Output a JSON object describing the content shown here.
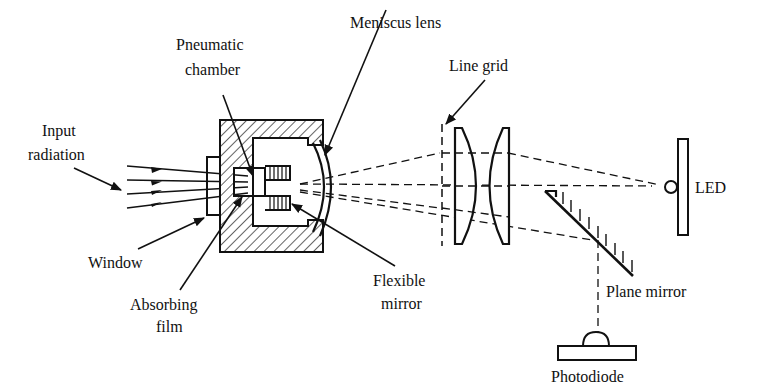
{
  "diagram": {
    "type": "optical-schematic",
    "labels": {
      "input_radiation_1": "Input",
      "input_radiation_2": "radiation",
      "pneumatic_chamber_1": "Pneumatic",
      "pneumatic_chamber_2": "chamber",
      "meniscus_lens": "Meniscus lens",
      "line_grid": "Line grid",
      "led": "LED",
      "window": "Window",
      "absorbing_film_1": "Absorbing",
      "absorbing_film_2": "film",
      "flexible_mirror_1": "Flexible",
      "flexible_mirror_2": "mirror",
      "plane_mirror": "Plane mirror",
      "photodiode": "Photodiode"
    },
    "components": [
      "Window",
      "Absorbing film",
      "Pneumatic chamber",
      "Flexible mirror",
      "Meniscus lens",
      "Line grid",
      "Lens pair",
      "LED",
      "Plane mirror",
      "Photodiode"
    ],
    "colors": {
      "line": "#111111",
      "background": "#ffffff"
    }
  }
}
